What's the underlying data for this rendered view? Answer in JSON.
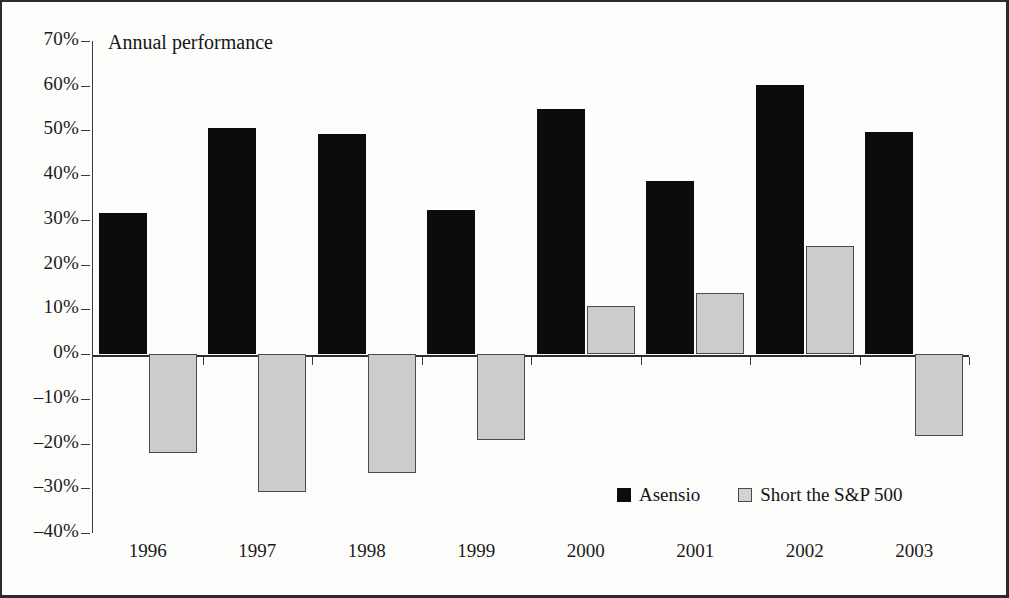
{
  "chart_data": {
    "type": "bar",
    "title": "Annual performance",
    "xlabel": "",
    "ylabel": "",
    "categories": [
      "1996",
      "1997",
      "1998",
      "1999",
      "2000",
      "2001",
      "2002",
      "2003"
    ],
    "series": [
      {
        "name": "Asensio",
        "color": "#0c0c0c",
        "values": [
          31.5,
          50.5,
          49.3,
          32.3,
          54.8,
          38.7,
          60.2,
          49.7
        ]
      },
      {
        "name": "Short the S&P 500",
        "color": "#cccccc",
        "values": [
          -22.2,
          -30.9,
          -26.6,
          -19.1,
          10.7,
          13.7,
          24.2,
          -18.4
        ]
      }
    ],
    "ylim": [
      -40,
      70
    ],
    "ytick_values": [
      70,
      60,
      50,
      40,
      30,
      20,
      10,
      0,
      -10,
      -20,
      -30,
      -40
    ],
    "ytick_labels": [
      "70%",
      "60%",
      "50%",
      "40%",
      "30%",
      "20%",
      "10%",
      "0%",
      "–10%",
      "–20%",
      "–30%",
      "–40%"
    ],
    "grid": false,
    "legend_position": "inside-bottom-right",
    "legend": [
      "Asensio",
      "Short the S&P 500"
    ]
  }
}
